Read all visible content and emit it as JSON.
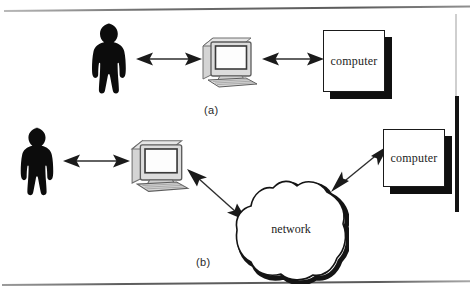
{
  "figure": {
    "background_color": "#ffffff",
    "ink_color": "#1a1a1a",
    "shadow_color": "#101010"
  },
  "panels": [
    {
      "id": "a",
      "caption": "(a)",
      "nodes": [
        {
          "name": "person",
          "type": "silhouette",
          "label": ""
        },
        {
          "name": "workstation",
          "type": "desktop-computer",
          "label": ""
        },
        {
          "name": "computer",
          "type": "box",
          "label": "computer"
        }
      ],
      "connections": [
        {
          "name": "person-to-workstation",
          "from": "person",
          "to": "workstation",
          "style": "double-arrow",
          "orientation": "horizontal"
        },
        {
          "name": "workstation-to-computer",
          "from": "workstation",
          "to": "computer",
          "style": "double-arrow",
          "orientation": "horizontal"
        }
      ]
    },
    {
      "id": "b",
      "caption": "(b)",
      "nodes": [
        {
          "name": "person",
          "type": "silhouette",
          "label": ""
        },
        {
          "name": "workstation",
          "type": "desktop-computer",
          "label": ""
        },
        {
          "name": "network",
          "type": "cloud",
          "label": "network"
        },
        {
          "name": "computer",
          "type": "box",
          "label": "computer"
        }
      ],
      "connections": [
        {
          "name": "person-to-workstation",
          "from": "person",
          "to": "workstation",
          "style": "double-arrow",
          "orientation": "horizontal"
        },
        {
          "name": "workstation-to-network",
          "from": "workstation",
          "to": "network",
          "style": "double-arrow",
          "orientation": "diagonal-down-right"
        },
        {
          "name": "network-to-computer",
          "from": "network",
          "to": "computer",
          "style": "double-arrow",
          "orientation": "diagonal-up-right"
        }
      ]
    }
  ],
  "labels": {
    "caption_a": "(a)",
    "caption_b": "(b)",
    "computer_a": "computer",
    "computer_b": "computer",
    "network": "network"
  }
}
